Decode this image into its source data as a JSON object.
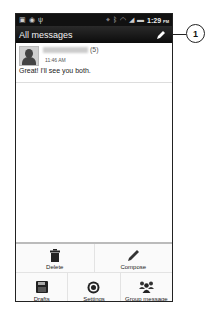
{
  "status_bar": {
    "left_icons": [
      "notification-icon",
      "alarm-icon",
      "usb-icon"
    ],
    "right_icons": [
      "gps-icon",
      "bluetooth-icon",
      "wifi-icon",
      "signal-icon",
      "battery-icon"
    ],
    "time": "1:29",
    "ampm": "PM"
  },
  "header": {
    "title": "All messages",
    "compose_icon": "pencil-icon"
  },
  "messages": [
    {
      "name": "",
      "count": "(5)",
      "time": "11:46 AM",
      "snippet": "Great! I'll see you both."
    }
  ],
  "menu": {
    "row1": [
      {
        "label": "Delete",
        "icon": "trash-icon"
      },
      {
        "label": "Compose",
        "icon": "pencil-icon"
      }
    ],
    "row2": [
      {
        "label": "Drafts",
        "icon": "floppy-disk-icon"
      },
      {
        "label": "Settings",
        "icon": "gear-icon"
      },
      {
        "label": "Group message",
        "icon": "group-icon"
      }
    ]
  },
  "callout": {
    "number": "1"
  }
}
